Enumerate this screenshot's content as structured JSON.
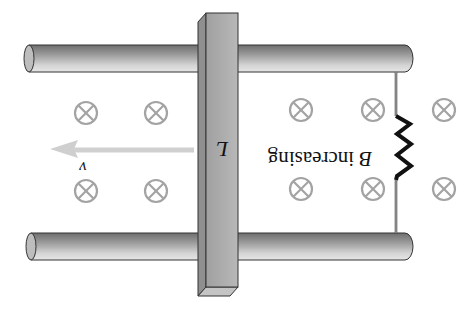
{
  "diagram": {
    "orientation": "rotated-180",
    "labels": {
      "bar_length": "L",
      "velocity": "v",
      "field_B": "B",
      "field_desc": "increasing"
    },
    "field_symbol": "⊗",
    "field_symbol_meaning": "magnetic field into page",
    "field_positions": [
      {
        "x": 86,
        "y": 113
      },
      {
        "x": 156,
        "y": 113
      },
      {
        "x": 301,
        "y": 110
      },
      {
        "x": 373,
        "y": 110
      },
      {
        "x": 444,
        "y": 110
      },
      {
        "x": 86,
        "y": 191
      },
      {
        "x": 156,
        "y": 191
      },
      {
        "x": 301,
        "y": 189
      },
      {
        "x": 373,
        "y": 189
      },
      {
        "x": 444,
        "y": 189
      }
    ],
    "colors": {
      "rail_dark": "#5a5a5a",
      "rail_light": "#d8d8d8",
      "bar_face": "#a9a9a9",
      "bar_side": "#8c8c8c",
      "field_symbol": "#a0a0a0",
      "arrow": "#cfcfcf",
      "resistor": "#111111",
      "outline": "#333333"
    }
  }
}
